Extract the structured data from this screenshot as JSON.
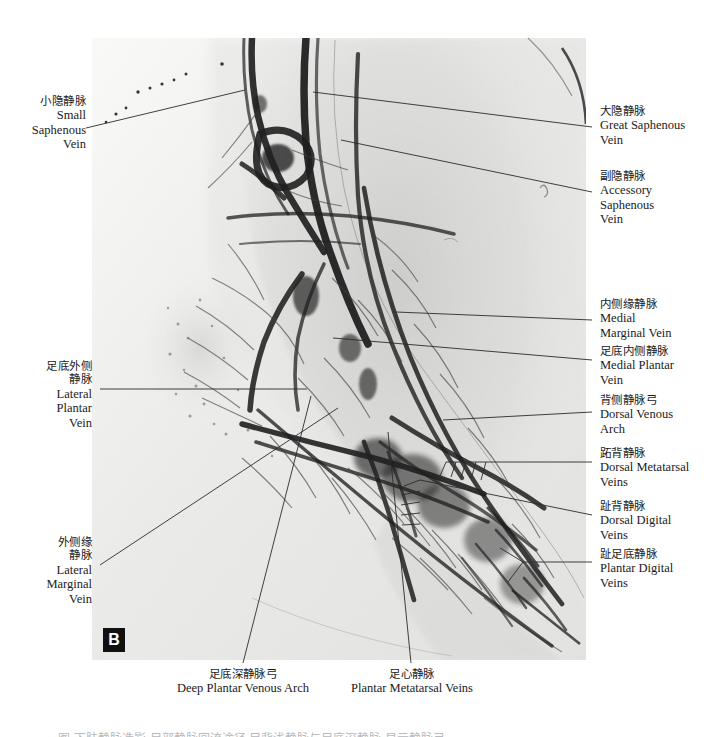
{
  "figure": {
    "panel_letter": "B",
    "modality": "foot venogram radiograph",
    "cut_caption": "图 下肢静脉造影 足部静脉回流途径 足背浅静脉与足底深静脉 显示静脉弓"
  },
  "labels": {
    "small_saphenous": {
      "cn": "小隐静脉",
      "en": [
        "Small",
        "Saphenous",
        "Vein"
      ]
    },
    "great_saphenous": {
      "cn": "大隐静脉",
      "en": [
        "Great Saphenous",
        "Vein"
      ]
    },
    "accessory_saphenous": {
      "cn": "副隐静脉",
      "en": [
        "Accessory",
        "Saphenous",
        "Vein"
      ]
    },
    "medial_marginal": {
      "cn": "内侧缘静脉",
      "en": [
        "Medial",
        "Marginal Vein"
      ]
    },
    "medial_plantar": {
      "cn": "足底内侧静脉",
      "en": [
        "Medial Plantar",
        "Vein"
      ]
    },
    "dorsal_venous_arch": {
      "cn": "背侧静脉弓",
      "en": [
        "Dorsal Venous",
        "Arch"
      ]
    },
    "dorsal_metatarsal": {
      "cn": "跖背静脉",
      "en": [
        "Dorsal Metatarsal",
        "Veins"
      ]
    },
    "dorsal_digital": {
      "cn": "趾背静脉",
      "en": [
        "Dorsal Digital",
        "Veins"
      ]
    },
    "plantar_digital": {
      "cn": "趾足底静脉",
      "en": [
        "Plantar Digital",
        "Veins"
      ]
    },
    "lateral_plantar": {
      "cn": "足底外侧",
      "cn2": "静脉",
      "en": [
        "Lateral",
        "Plantar",
        "Vein"
      ]
    },
    "lateral_marginal": {
      "cn": "外侧缘",
      "cn2": "静脉",
      "en": [
        "Lateral",
        "Marginal",
        "Vein"
      ]
    },
    "deep_plantar_arch": {
      "cn": "足底深静脉弓",
      "en": [
        "Deep Plantar Venous Arch"
      ]
    },
    "plantar_metatarsal": {
      "cn": "足心静脉",
      "en": [
        "Plantar Metatarsal Veins"
      ]
    }
  },
  "colors": {
    "page_background": "#ffffff",
    "plate_background": "#f2f2f0",
    "vessel": "#1c1c1c",
    "text": "#1a1a1a",
    "leader_line": "#2b2b2b",
    "panel_letter_bg": "#111111",
    "panel_letter_fg": "#ffffff"
  }
}
